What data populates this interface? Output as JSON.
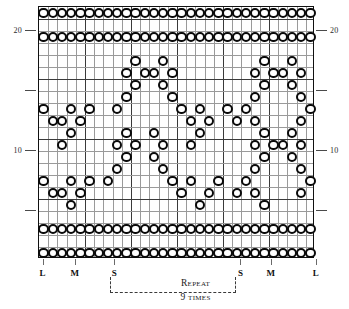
{
  "chart": {
    "type": "knitting-colorwork-grid",
    "columns": 30,
    "rows": 21,
    "symbol": "open-circle-bead",
    "symbol_meaning": "contrast color stitch",
    "grid_color": "#9a9a9a",
    "major_grid_color": "#3a3a3a",
    "bead_color": "#0a0a0a",
    "background": "#ffffff"
  },
  "axis": {
    "left_labels": [
      {
        "text": "20",
        "row": 20
      },
      {
        "text": "",
        "row": 15
      },
      {
        "text": "10",
        "row": 10
      },
      {
        "text": "",
        "row": 5
      }
    ],
    "right_labels": [
      {
        "text": "20",
        "row": 20
      },
      {
        "text": "",
        "row": 15
      },
      {
        "text": "10",
        "row": 10
      },
      {
        "text": "",
        "row": 5
      }
    ]
  },
  "column_markers": [
    {
      "label": "L",
      "col": 0
    },
    {
      "label": "M",
      "col": 3.5
    },
    {
      "label": "S",
      "col": 7.8
    },
    {
      "label": "S",
      "col": 21.5
    },
    {
      "label": "M",
      "col": 24.8
    },
    {
      "label": "L",
      "col": 29.7
    }
  ],
  "repeat": {
    "label": "Repeat",
    "count_text": "9 times",
    "start_col": 7.8,
    "end_col": 21.5
  },
  "chart_data": {
    "type": "heatmap",
    "xlabel": "",
    "ylabel": "",
    "ncols": 30,
    "nrows": 21,
    "legend": [
      "open circle = contrast color bead/stitch"
    ],
    "row_labels_left": [
      "20",
      "10"
    ],
    "row_labels_right": [
      "20",
      "10"
    ],
    "rows_top_to_bottom": [
      {
        "row": 21,
        "cols": [
          0,
          1,
          2,
          3,
          4,
          5,
          6,
          7,
          8,
          9,
          10,
          11,
          12,
          13,
          14,
          15,
          16,
          17,
          18,
          19,
          20,
          21,
          22,
          23,
          24,
          25,
          26,
          27,
          28,
          29
        ]
      },
      {
        "row": 20,
        "cols": []
      },
      {
        "row": 19,
        "cols": [
          0,
          1,
          2,
          3,
          4,
          5,
          6,
          7,
          8,
          9,
          10,
          11,
          12,
          13,
          14,
          15,
          16,
          17,
          18,
          19,
          20,
          21,
          22,
          23,
          24,
          25,
          26,
          27,
          28,
          29
        ]
      },
      {
        "row": 18,
        "cols": []
      },
      {
        "row": 17,
        "cols": [
          10,
          13,
          24,
          27
        ]
      },
      {
        "row": 16,
        "cols": [
          9,
          11,
          12,
          14,
          23,
          25,
          26,
          28
        ]
      },
      {
        "row": 15,
        "cols": [
          10,
          13,
          24,
          27
        ]
      },
      {
        "row": 14,
        "cols": [
          9,
          14,
          23,
          28
        ]
      },
      {
        "row": 13,
        "cols": [
          0,
          3,
          5,
          8,
          15,
          17,
          20,
          22,
          29
        ]
      },
      {
        "row": 12,
        "cols": [
          1,
          2,
          4,
          16,
          18,
          21,
          23,
          28
        ]
      },
      {
        "row": 11,
        "cols": [
          3,
          9,
          12,
          17,
          24,
          27
        ]
      },
      {
        "row": 10,
        "cols": [
          2,
          8,
          10,
          13,
          16,
          23,
          25,
          26,
          28
        ]
      },
      {
        "row": 9,
        "cols": [
          9,
          12,
          24,
          27
        ]
      },
      {
        "row": 8,
        "cols": [
          8,
          13,
          23,
          28
        ]
      },
      {
        "row": 7,
        "cols": [
          0,
          3,
          5,
          7,
          14,
          16,
          19,
          22,
          29
        ]
      },
      {
        "row": 6,
        "cols": [
          1,
          2,
          4,
          15,
          18,
          21,
          23,
          28
        ]
      },
      {
        "row": 5,
        "cols": [
          3,
          17,
          24
        ]
      },
      {
        "row": 4,
        "cols": []
      },
      {
        "row": 3,
        "cols": [
          0,
          1,
          2,
          3,
          4,
          5,
          6,
          7,
          8,
          9,
          10,
          11,
          12,
          13,
          14,
          15,
          16,
          17,
          18,
          19,
          20,
          21,
          22,
          23,
          24,
          25,
          26,
          27,
          28,
          29
        ]
      },
      {
        "row": 2,
        "cols": []
      },
      {
        "row": 1,
        "cols": [
          0,
          1,
          2,
          3,
          4,
          5,
          6,
          7,
          8,
          9,
          10,
          11,
          12,
          13,
          14,
          15,
          16,
          17,
          18,
          19,
          20,
          21,
          22,
          23,
          24,
          25,
          26,
          27,
          28,
          29
        ]
      }
    ]
  }
}
